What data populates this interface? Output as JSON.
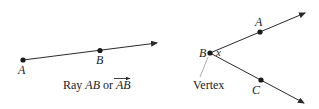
{
  "ray_diagram": {
    "point_a_label": "A",
    "point_b_label": "B",
    "caption_prefix": "Ray ",
    "caption_ray": "AB",
    "caption_or": " or ",
    "caption_notation": "AB"
  },
  "angle_diagram": {
    "point_a_label": "A",
    "vertex_label": "B",
    "angle_label": "x",
    "point_c_label": "C",
    "vertex_caption": "Vertex"
  },
  "colors": {
    "stroke": "#2a2a2a",
    "leader": "#999999",
    "background": "#ffffff"
  }
}
